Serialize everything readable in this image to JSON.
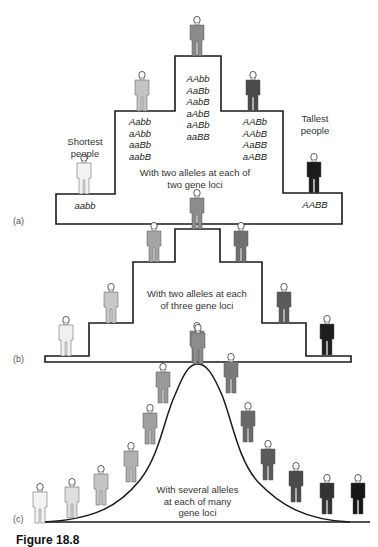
{
  "panels": {
    "a": {
      "label": "(a)",
      "description": "With two alleles at each of two gene loci",
      "description_lines": [
        "With two alleles at each of",
        "two gene loci"
      ],
      "shortest_label": [
        "Shortest",
        "people"
      ],
      "tallest_label": [
        "Tallest",
        "people"
      ],
      "classes": [
        {
          "genotypes": [
            "aabb"
          ]
        },
        {
          "genotypes": [
            "Aabb",
            "aAbb",
            "aaBb",
            "aabB"
          ]
        },
        {
          "genotypes": [
            "AAbb",
            "AaBb",
            "AabB",
            "aAbB",
            "aABb",
            "aaBB"
          ]
        },
        {
          "genotypes": [
            "AABb",
            "AAbB",
            "AaBB",
            "aABB"
          ]
        },
        {
          "genotypes": [
            "AABB"
          ]
        }
      ]
    },
    "b": {
      "label": "(b)",
      "description_lines": [
        "With two alleles at each",
        "of three gene loci"
      ]
    },
    "c": {
      "label": "(c)",
      "description_lines": [
        "With several alleles",
        "at each of many",
        "gene loci"
      ]
    }
  },
  "caption": "Figure 18.8",
  "colors": {
    "line": "#1a1a1a",
    "shades": [
      "#f2f2f2",
      "#c8c8c8",
      "#9a9a9a",
      "#6e6e6e",
      "#454545",
      "#1c1c1c"
    ]
  }
}
